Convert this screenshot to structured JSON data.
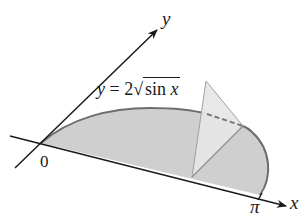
{
  "figure": {
    "type": "3d-solid-cross-section",
    "axes": {
      "x_label": "x",
      "y_label": "y",
      "origin_label": "0",
      "x_end_label": "π"
    },
    "curve_label": {
      "lhs": "y",
      "equals": "=",
      "coefficient": "2",
      "radical": "√",
      "radicand_fn": "sin",
      "radicand_var": "x"
    },
    "colors": {
      "axis": "#1a1a1a",
      "region_fill": "#cfcfcf",
      "curve_stroke": "#6e6e6e",
      "cross_section_fill": "#e4e4e4",
      "cross_section_stroke": "#9a9a9a",
      "dashed_edge": "#777777"
    }
  }
}
